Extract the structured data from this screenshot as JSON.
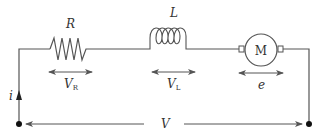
{
  "diagram": {
    "type": "circuit",
    "colors": {
      "wire": "#555555",
      "text": "#333333",
      "node": "#111111",
      "background": "#ffffff"
    },
    "components": {
      "resistor": {
        "label": "R",
        "voltage_label": "V",
        "voltage_sub": "R"
      },
      "inductor": {
        "label": "L",
        "voltage_label": "V",
        "voltage_sub": "L"
      },
      "motor": {
        "symbol": "M",
        "emf_label": "e"
      }
    },
    "current_label": "i",
    "supply_voltage_label": "V"
  }
}
